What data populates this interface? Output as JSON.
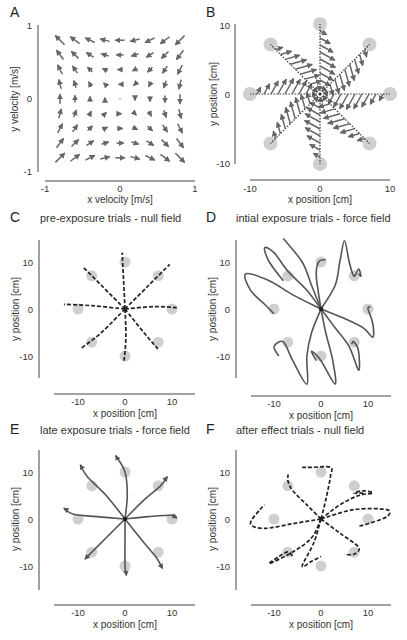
{
  "figure": {
    "panels": {
      "A": {
        "letter": "A",
        "title": "",
        "xlabel": "x velocity [m/s]",
        "ylabel": "y velocity [m/s]",
        "xticks": [
          "-1",
          "0",
          "1"
        ],
        "yticks": [
          "1",
          "0",
          "-1"
        ]
      },
      "B": {
        "letter": "B",
        "title": "",
        "xlabel": "x position [cm]",
        "ylabel": "y position [cm]",
        "xticks": [
          "-10",
          "0",
          "10"
        ],
        "yticks": [
          "10",
          "0",
          "-10"
        ]
      },
      "C": {
        "letter": "C",
        "title": "pre-exposure trials - null field",
        "xlabel": "x position [cm]",
        "ylabel": "y position [cm]",
        "xticks": [
          "-10",
          "0",
          "10"
        ],
        "yticks": [
          "10",
          "0",
          "-10"
        ]
      },
      "D": {
        "letter": "D",
        "title": "intial exposure trials - force field",
        "xlabel": "x position [cm]",
        "ylabel": "y position [cm]",
        "xticks": [
          "-10",
          "0",
          "10"
        ],
        "yticks": [
          "10",
          "0",
          "-10"
        ]
      },
      "E": {
        "letter": "E",
        "title": "late exposure trials - force field",
        "xlabel": "x position [cm]",
        "ylabel": "y position [cm]",
        "xticks": [
          "-10",
          "0",
          "10"
        ],
        "yticks": [
          "10",
          "0",
          "-10"
        ]
      },
      "F": {
        "letter": "F",
        "title": "after effect trials - null field",
        "xlabel": "x position [cm]",
        "ylabel": "y position [cm]",
        "xticks": [
          "-10",
          "0",
          "10"
        ],
        "yticks": [
          "10",
          "0",
          "-10"
        ]
      }
    }
  },
  "chart_data": [
    {
      "panel": "A",
      "type": "quiver",
      "title": "",
      "xlabel": "x velocity [m/s]",
      "ylabel": "y velocity [m/s]",
      "xlim": [
        -1,
        1
      ],
      "ylim": [
        -1,
        1
      ],
      "grid_x": [
        -0.8,
        -0.6,
        -0.4,
        -0.2,
        0,
        0.2,
        0.4,
        0.6,
        0.8
      ],
      "grid_y": [
        0.8,
        0.6,
        0.4,
        0.2,
        0,
        -0.2,
        -0.4,
        -0.6,
        -0.8
      ],
      "description": "Curl-type velocity-dependent force field: F = B*v with rotation; arrows point up along left side, left along top, down along right, right along bottom"
    },
    {
      "panel": "B",
      "type": "quiver",
      "xlabel": "x position [cm]",
      "ylabel": "y position [cm]",
      "xlim": [
        -10,
        10
      ],
      "ylim": [
        -10,
        10
      ],
      "targets": [
        [
          0,
          10
        ],
        [
          7.07,
          7.07
        ],
        [
          10,
          0
        ],
        [
          7.07,
          -7.07
        ],
        [
          0,
          -10
        ],
        [
          -7.07,
          -7.07
        ],
        [
          -10,
          0
        ],
        [
          -7.07,
          7.07
        ]
      ],
      "description": "Straight dotted reach paths to 8 targets with perpendicular force arrows along each path"
    },
    {
      "panel": "C",
      "type": "line",
      "style": "dashed",
      "title": "pre-exposure trials - null field",
      "xlabel": "x position [cm]",
      "ylabel": "y position [cm]",
      "xlim": [
        -15,
        15
      ],
      "ylim": [
        -15,
        15
      ],
      "targets": [
        [
          0,
          10
        ],
        [
          7.07,
          7.07
        ],
        [
          10,
          0
        ],
        [
          7.07,
          -7.07
        ],
        [
          0,
          -10
        ],
        [
          -7.07,
          -7.07
        ],
        [
          -10,
          0
        ],
        [
          -7.07,
          7.07
        ]
      ],
      "series": [
        {
          "name": "to 0,10",
          "points": [
            [
              0,
              0
            ],
            [
              -0.3,
              6
            ],
            [
              -0.6,
              12
            ]
          ]
        },
        {
          "name": "to 7,7",
          "points": [
            [
              0,
              0
            ],
            [
              5,
              5
            ],
            [
              9.5,
              9.5
            ]
          ]
        },
        {
          "name": "to 10,0",
          "points": [
            [
              0,
              0
            ],
            [
              6,
              0.5
            ],
            [
              11,
              0.3
            ]
          ]
        },
        {
          "name": "to 7,-7",
          "points": [
            [
              0,
              0
            ],
            [
              4,
              -5
            ],
            [
              7,
              -8.5
            ]
          ]
        },
        {
          "name": "to 0,-10",
          "points": [
            [
              0,
              0
            ],
            [
              0.2,
              -6
            ],
            [
              -0.2,
              -11
            ]
          ]
        },
        {
          "name": "to -7,-7",
          "points": [
            [
              0,
              0
            ],
            [
              -5,
              -5
            ],
            [
              -9.5,
              -8.5
            ]
          ]
        },
        {
          "name": "to -10,0",
          "points": [
            [
              0,
              0
            ],
            [
              -7,
              0.7
            ],
            [
              -13,
              1
            ]
          ]
        },
        {
          "name": "to -7,7",
          "points": [
            [
              0,
              0
            ],
            [
              -5,
              5
            ],
            [
              -9,
              9
            ]
          ]
        }
      ]
    },
    {
      "panel": "D",
      "type": "line",
      "style": "solid",
      "title": "intial exposure trials - force field",
      "xlabel": "x position [cm]",
      "ylabel": "y position [cm]",
      "xlim": [
        -15,
        15
      ],
      "ylim": [
        -15,
        15
      ],
      "description": "Curved, deflected trajectories with hooks near targets during initial force field exposure"
    },
    {
      "panel": "E",
      "type": "line",
      "style": "solid",
      "title": "late exposure trials - force field",
      "xlabel": "x position [cm]",
      "ylabel": "y position [cm]",
      "xlim": [
        -15,
        15
      ],
      "ylim": [
        -15,
        15
      ],
      "description": "Nearly straight trajectories after adaptation, slight curvature"
    },
    {
      "panel": "F",
      "type": "line",
      "style": "dashed",
      "title": "after effect trials - null field",
      "xlabel": "x position [cm]",
      "ylabel": "y position [cm]",
      "xlim": [
        -15,
        15
      ],
      "ylim": [
        -15,
        15
      ],
      "description": "Mirror-image curved after-effect trajectories with hooks"
    }
  ]
}
